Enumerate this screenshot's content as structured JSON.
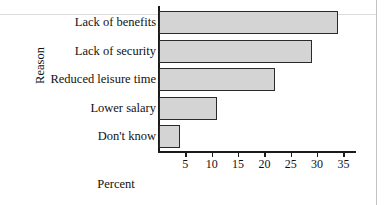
{
  "chart_data": {
    "type": "bar",
    "orientation": "horizontal",
    "title": "",
    "xlabel": "Percent",
    "ylabel": "Reason",
    "categories": [
      "Lack of benefits",
      "Lack of security",
      "Reduced leisure time",
      "Lower salary",
      "Don't know"
    ],
    "values": [
      34,
      29,
      22,
      11,
      4
    ],
    "xlim": [
      0,
      37.5
    ],
    "xticks": [
      5,
      10,
      15,
      20,
      25,
      30,
      35
    ],
    "xticklabels": [
      "5",
      "10",
      "15",
      "20",
      "25",
      "30",
      "35"
    ],
    "grid": false,
    "legend": null,
    "bar_fill_color": "#d4d4d4",
    "bar_edge_color": "#2a2a2a",
    "axis_color": "#1a1a1a",
    "background_color": "#ffffff"
  }
}
